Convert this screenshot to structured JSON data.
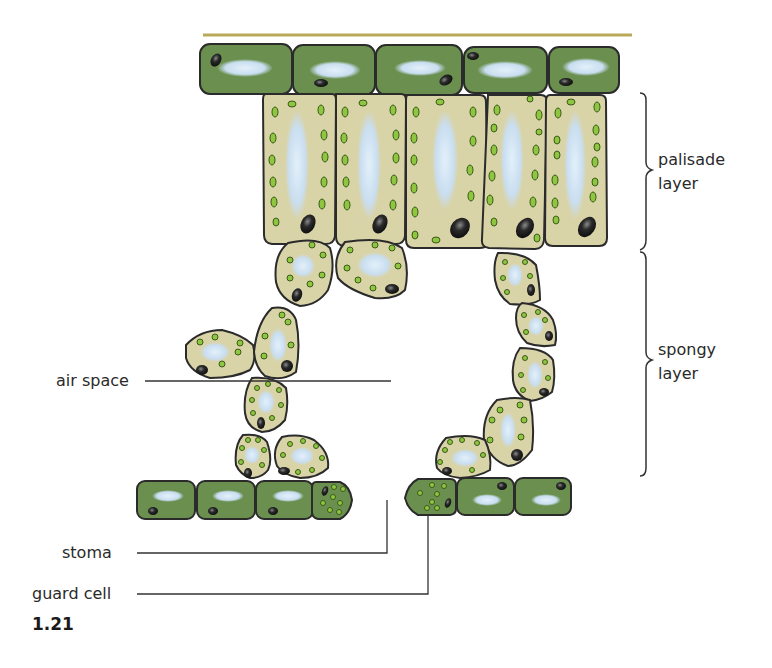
{
  "figure": {
    "number": "1.21"
  },
  "labels": {
    "palisade": "palisade\nlayer",
    "palisade_line1": "palisade",
    "palisade_line2": "layer",
    "spongy_line1": "spongy",
    "spongy_line2": "layer",
    "air_space": "air space",
    "stoma": "stoma",
    "guard_cell": "guard cell"
  },
  "colors": {
    "cuticle": "#b9a95a",
    "epidermis_fill": "#6a8f4f",
    "mesophyll_fill": "#d9d3a8",
    "chloroplast": "#8ec63f",
    "vacuole": "#cfe3f2",
    "nucleus": "#2a2a2a",
    "outline": "#2b2b2b",
    "line": "#333333"
  },
  "structures": [
    {
      "name": "cuticle"
    },
    {
      "name": "upper epidermis",
      "cells": 5
    },
    {
      "name": "palisade layer",
      "cells": 5
    },
    {
      "name": "spongy layer"
    },
    {
      "name": "air space"
    },
    {
      "name": "lower epidermis"
    },
    {
      "name": "stoma"
    },
    {
      "name": "guard cell",
      "count": 2
    }
  ]
}
